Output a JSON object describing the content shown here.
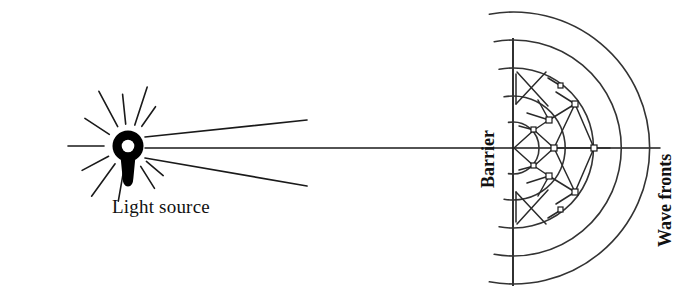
{
  "figure": {
    "background_color": "#ffffff",
    "ink_color": "#1a1a1a",
    "width": 693,
    "height": 294
  },
  "labels": {
    "light_source": "Light source",
    "barrier": "Barrier",
    "wave_fronts": "Wave fronts"
  },
  "diagram_data": {
    "type": "diagram",
    "axis_y": 148,
    "light_source": {
      "name": "light-source-bulb",
      "center_x": 128,
      "center_y": 146,
      "outer_radius": 16,
      "inner_radius": 6.5,
      "stem": "tapered keyhole stem below ring",
      "short_rays": [
        {
          "angle_deg": -118,
          "r1": 22,
          "r2": 62
        },
        {
          "angle_deg": -96,
          "r1": 22,
          "r2": 52
        },
        {
          "angle_deg": -72,
          "r1": 22,
          "r2": 62
        },
        {
          "angle_deg": -55,
          "r1": 24,
          "r2": 48
        },
        {
          "angle_deg": -148,
          "r1": 22,
          "r2": 52
        },
        {
          "angle_deg": 180,
          "r1": 24,
          "r2": 60
        },
        {
          "angle_deg": 152,
          "r1": 22,
          "r2": 52
        },
        {
          "angle_deg": 126,
          "r1": 22,
          "r2": 62
        },
        {
          "angle_deg": 100,
          "r1": 24,
          "r2": 56
        },
        {
          "angle_deg": 58,
          "r1": 24,
          "r2": 50
        },
        {
          "angle_deg": 40,
          "r1": 24,
          "r2": 46
        }
      ],
      "long_rays": [
        {
          "name": "upper-ray",
          "x2": 307,
          "y2": 120
        },
        {
          "name": "central-ray",
          "x2": 660,
          "y2": 148
        },
        {
          "name": "lower-ray",
          "x2": 307,
          "y2": 186
        }
      ]
    },
    "barrier": {
      "name": "barrier-line",
      "x": 513,
      "y_top": 38,
      "y_bottom": 286,
      "aperture_y": 148
    },
    "wave_fronts": {
      "name": "circular-wavefront-arcs",
      "center_x": 513,
      "center_y": 148,
      "arc_radii": [
        26,
        52,
        80,
        108,
        136
      ],
      "arc_span_deg": 160,
      "description": "concentric circular arcs spreading right from the aperture"
    },
    "ray_lattice": {
      "description": "network of crossing construction lines with small square nodes at intersections",
      "nodes": [
        {
          "x": 554,
          "y": 148
        },
        {
          "x": 594,
          "y": 148
        },
        {
          "x": 549,
          "y": 120
        },
        {
          "x": 549,
          "y": 176
        },
        {
          "x": 575,
          "y": 104
        },
        {
          "x": 575,
          "y": 192
        },
        {
          "x": 534,
          "y": 130
        },
        {
          "x": 534,
          "y": 166
        },
        {
          "x": 561,
          "y": 86
        },
        {
          "x": 561,
          "y": 210
        }
      ]
    }
  }
}
